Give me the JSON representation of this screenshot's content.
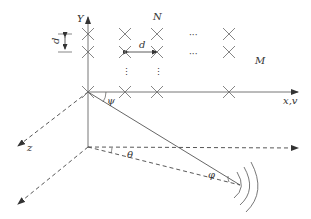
{
  "diagram": {
    "type": "uniform planar antenna array geometry",
    "labels": {
      "y_axis": "Y",
      "x_axis": "x,v",
      "z_axis": "z",
      "rows_count": "N",
      "cols_count": "M",
      "vertical_spacing": "d",
      "horizontal_spacing": "d",
      "elevation_angle": "ψ",
      "azimuth_angle": "θ",
      "incident_angle": "φ",
      "ellipsis_h": "···",
      "ellipsis_v": "⋮"
    },
    "elements": [
      {
        "row": 0,
        "col": 0
      },
      {
        "row": 0,
        "col": 1
      },
      {
        "row": 0,
        "col": 2
      },
      {
        "row": 0,
        "col": "M-1"
      },
      {
        "row": 1,
        "col": 0
      },
      {
        "row": 1,
        "col": 1
      },
      {
        "row": 1,
        "col": 2
      },
      {
        "row": 1,
        "col": "M-1"
      },
      {
        "row": "N-1",
        "col": 0
      },
      {
        "row": "N-1",
        "col": 1
      },
      {
        "row": "N-1",
        "col": 2
      },
      {
        "row": "N-1",
        "col": "M-1"
      }
    ],
    "colors": {
      "line": "#555555",
      "text": "#333333"
    }
  }
}
